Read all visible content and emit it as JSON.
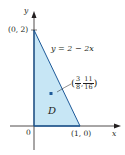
{
  "figure": {
    "region_label": "D",
    "curve_label": "y = 2 − 2x",
    "axes": {
      "x_label": "x",
      "y_label": "y",
      "origin_label": "0"
    },
    "vertices": [
      {
        "label": "(0, 2)",
        "x": 0,
        "y": 2
      },
      {
        "label": "(1, 0)",
        "x": 1,
        "y": 0
      }
    ],
    "centroid": {
      "x_num": "3",
      "x_den": "8",
      "y_num": "11",
      "y_den": "16",
      "open": "(",
      "close": ")",
      "sep": ","
    },
    "colors": {
      "fill": "#c7e6f5",
      "line": "#1e5a99",
      "point": "#1e5a99",
      "axis": "#231f20"
    }
  }
}
